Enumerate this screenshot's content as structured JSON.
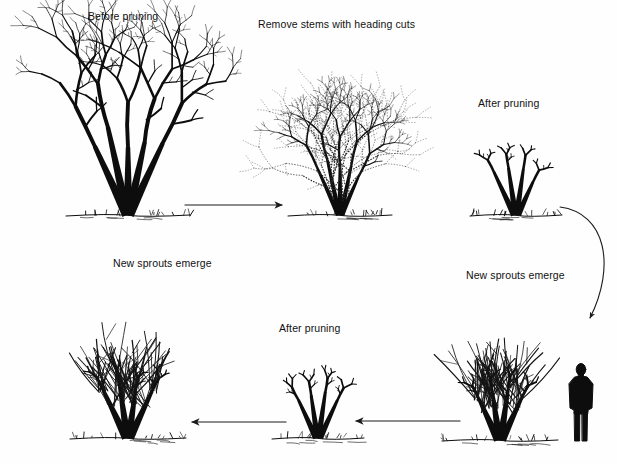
{
  "diagram": {
    "title_visible": false,
    "background_color": "#fefefe",
    "ink_color": "#0d0d0d",
    "width": 617,
    "height": 464,
    "labels": [
      {
        "id": "before-pruning",
        "text": "Before pruning",
        "x": 88,
        "y": 11
      },
      {
        "id": "remove-stems",
        "text": "Remove stems with heading cuts",
        "x": 258,
        "y": 19
      },
      {
        "id": "after-pruning-top",
        "text": "After pruning",
        "x": 478,
        "y": 98
      },
      {
        "id": "new-sprouts-left",
        "text": "New sprouts emerge",
        "x": 113,
        "y": 258
      },
      {
        "id": "new-sprouts-right",
        "text": "New sprouts emerge",
        "x": 466,
        "y": 270
      },
      {
        "id": "after-pruning-bottom",
        "text": "After pruning",
        "x": 279,
        "y": 323
      }
    ],
    "stages": [
      {
        "id": "stage-1-before-pruning",
        "label": "Before pruning",
        "order": 1,
        "style": "dense-solid-shrub",
        "center_x": 128,
        "ground_y": 215
      },
      {
        "id": "stage-2-remove-stems",
        "label": "Remove stems with heading cuts",
        "order": 2,
        "style": "dotted-removal-overlay",
        "center_x": 340,
        "ground_y": 215
      },
      {
        "id": "stage-3-after-pruning-top",
        "label": "After pruning",
        "order": 3,
        "style": "stubbed-framework",
        "center_x": 516,
        "ground_y": 215
      },
      {
        "id": "stage-4-new-sprouts-right",
        "label": "New sprouts emerge",
        "order": 4,
        "style": "regrown-sprouts",
        "center_x": 500,
        "ground_y": 440
      },
      {
        "id": "stage-5-after-pruning-bottom",
        "label": "After pruning",
        "order": 5,
        "style": "stubbed-framework",
        "center_x": 318,
        "ground_y": 438
      },
      {
        "id": "stage-6-new-sprouts-left",
        "label": "New sprouts emerge",
        "order": 6,
        "style": "regrown-sprouts",
        "center_x": 128,
        "ground_y": 438
      }
    ],
    "arrows": [
      {
        "id": "arrow-1-right",
        "direction": "right",
        "x1": 185,
        "y1": 205,
        "x2": 282,
        "y2": 205,
        "shape": "straight"
      },
      {
        "id": "arrow-2-curve",
        "direction": "down",
        "x1": 560,
        "y1": 207,
        "x2": 590,
        "y2": 318,
        "shape": "curved"
      },
      {
        "id": "arrow-3-left",
        "direction": "left",
        "x1": 460,
        "y1": 421,
        "x2": 356,
        "y2": 421,
        "shape": "straight"
      },
      {
        "id": "arrow-4-left",
        "direction": "left",
        "x1": 286,
        "y1": 422,
        "x2": 192,
        "y2": 422,
        "shape": "straight"
      }
    ],
    "figure": {
      "id": "human-silhouette",
      "description": "standing person for scale",
      "x": 569,
      "y": 364,
      "width": 24,
      "height": 77
    }
  }
}
